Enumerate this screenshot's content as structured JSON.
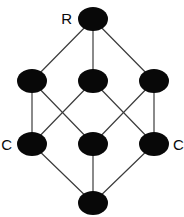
{
  "figure": {
    "type": "graph-diagram",
    "width": 184,
    "height": 217,
    "background_color": "#ffffff"
  },
  "style": {
    "node_color": "#080808",
    "edge_color": "#3c3c3c",
    "label_color": "#0a0a0a",
    "edge_width": 1.2,
    "node_rx": 15,
    "node_ry": 12
  },
  "chart_data": {
    "type": "graph",
    "title": "",
    "nodes": [
      {
        "id": "top",
        "label": "R",
        "label_side": "left",
        "x": 93,
        "y": 19,
        "rx": 15,
        "ry": 12
      },
      {
        "id": "mid-left",
        "label": "",
        "label_side": "none",
        "x": 32,
        "y": 81,
        "rx": 15,
        "ry": 12
      },
      {
        "id": "mid-center",
        "label": "",
        "label_side": "none",
        "x": 93,
        "y": 81,
        "rx": 15,
        "ry": 12
      },
      {
        "id": "mid-right",
        "label": "",
        "label_side": "none",
        "x": 154,
        "y": 81,
        "rx": 15,
        "ry": 12
      },
      {
        "id": "low-left",
        "label": "C",
        "label_side": "left",
        "x": 32,
        "y": 144,
        "rx": 15,
        "ry": 12
      },
      {
        "id": "low-center",
        "label": "",
        "label_side": "none",
        "x": 93,
        "y": 144,
        "rx": 15,
        "ry": 12
      },
      {
        "id": "low-right",
        "label": "C",
        "label_side": "right",
        "x": 154,
        "y": 144,
        "rx": 15,
        "ry": 12
      },
      {
        "id": "bottom",
        "label": "",
        "label_side": "none",
        "x": 93,
        "y": 203,
        "rx": 15,
        "ry": 12
      }
    ],
    "edges": [
      {
        "from": "top",
        "to": "mid-left"
      },
      {
        "from": "top",
        "to": "mid-center"
      },
      {
        "from": "top",
        "to": "mid-right"
      },
      {
        "from": "mid-left",
        "to": "low-left"
      },
      {
        "from": "mid-left",
        "to": "low-center"
      },
      {
        "from": "mid-center",
        "to": "low-left"
      },
      {
        "from": "mid-center",
        "to": "low-right"
      },
      {
        "from": "mid-right",
        "to": "low-center"
      },
      {
        "from": "mid-right",
        "to": "low-right"
      },
      {
        "from": "low-left",
        "to": "bottom"
      },
      {
        "from": "low-center",
        "to": "bottom"
      },
      {
        "from": "low-right",
        "to": "bottom"
      }
    ],
    "labels": [
      {
        "text": "R",
        "x": 72,
        "y": 24,
        "anchor": "end"
      },
      {
        "text": "C",
        "x": 12,
        "y": 150,
        "anchor": "end"
      },
      {
        "text": "C",
        "x": 173,
        "y": 150,
        "anchor": "start"
      }
    ]
  }
}
